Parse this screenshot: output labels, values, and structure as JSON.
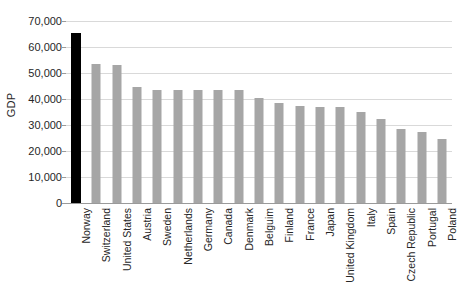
{
  "chart_data": {
    "type": "bar",
    "title": "",
    "xlabel": "",
    "ylabel": "GDP",
    "ylim": [
      0,
      70000
    ],
    "grid": true,
    "legend": false,
    "legend_position": "none",
    "y_ticks": [
      "0",
      "10,000",
      "20,000",
      "30,000",
      "40,000",
      "50,000",
      "60,000",
      "70,000"
    ],
    "y_tick_values": [
      0,
      10000,
      20000,
      30000,
      40000,
      50000,
      60000,
      70000
    ],
    "highlight_color": "#000000",
    "bar_color": "#a6a6a6",
    "gridline_color": "#d9d9d9",
    "axis_color": "#9a9a9a",
    "highlighted_category": "Norway",
    "categories": [
      "Norway",
      "Switzerland",
      "United States",
      "Austria",
      "Sweden",
      "Netherlands",
      "Germany",
      "Canada",
      "Denmark",
      "Belguim",
      "Finland",
      "France",
      "Japan",
      "United Kingdom",
      "Italy",
      "Spain",
      "Czech Republic",
      "Portugal",
      "Poland"
    ],
    "values": [
      65200,
      53500,
      53000,
      44500,
      43500,
      43500,
      43500,
      43500,
      43300,
      40500,
      38500,
      37500,
      37000,
      37000,
      35000,
      32500,
      28500,
      27500,
      24500
    ]
  }
}
